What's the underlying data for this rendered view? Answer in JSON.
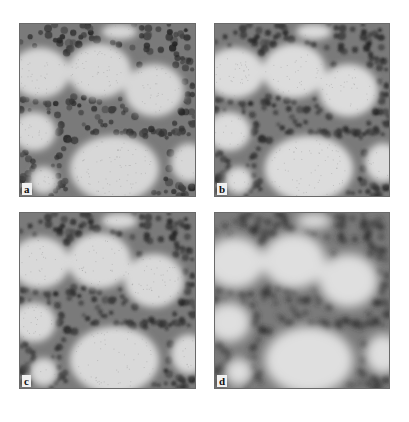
{
  "figure": {
    "panels": [
      {
        "id": "a",
        "label": "a",
        "x": 19,
        "y": 23,
        "w": 177,
        "h": 174,
        "blur": 0.6,
        "contrast": 1.0
      },
      {
        "id": "b",
        "label": "b",
        "x": 214,
        "y": 23,
        "w": 176,
        "h": 174,
        "blur": 0.9,
        "contrast": 1.25
      },
      {
        "id": "c",
        "label": "c",
        "x": 19,
        "y": 212,
        "w": 177,
        "h": 177,
        "blur": 1.0,
        "contrast": 1.1
      },
      {
        "id": "d",
        "label": "d",
        "x": 214,
        "y": 212,
        "w": 176,
        "h": 177,
        "blur": 2.6,
        "contrast": 1.35
      }
    ],
    "colors": {
      "background": "#ffffff",
      "dark": "#2e2e2e",
      "mid": "#707070",
      "light": "#d8d8d8"
    }
  }
}
